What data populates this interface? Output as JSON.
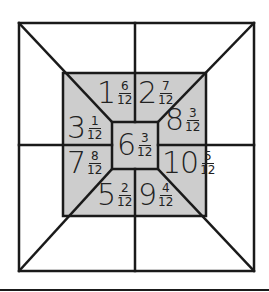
{
  "puzzle": {
    "colors": {
      "shade": "#cdcdcd",
      "line": "#1a1a1a",
      "background": "#ffffff"
    },
    "cells": [
      {
        "id": "top-left",
        "whole": "1",
        "num": "6",
        "den": "12",
        "x": 97,
        "y": 78
      },
      {
        "id": "top-right",
        "whole": "2",
        "num": "7",
        "den": "12",
        "x": 138,
        "y": 78
      },
      {
        "id": "left-upper",
        "whole": "3",
        "num": "1",
        "den": "12",
        "x": 67,
        "y": 113
      },
      {
        "id": "right-upper",
        "whole": "8",
        "num": "3",
        "den": "12",
        "x": 165,
        "y": 105
      },
      {
        "id": "center",
        "whole": "6",
        "num": "3",
        "den": "12",
        "x": 117,
        "y": 130
      },
      {
        "id": "left-lower",
        "whole": "7",
        "num": "8",
        "den": "12",
        "x": 67,
        "y": 148
      },
      {
        "id": "right-lower",
        "whole": "10",
        "num": "5",
        "den": "12",
        "x": 162,
        "y": 148
      },
      {
        "id": "bottom-left",
        "whole": "5",
        "num": "2",
        "den": "12",
        "x": 97,
        "y": 180
      },
      {
        "id": "bottom-right",
        "whole": "9",
        "num": "4",
        "den": "12",
        "x": 138,
        "y": 180
      }
    ]
  }
}
